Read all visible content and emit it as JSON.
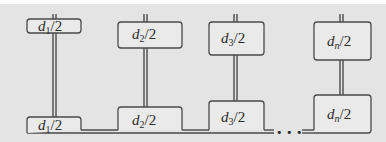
{
  "diagram": {
    "type": "tapered-stack-pairs",
    "colors": {
      "background": "#e4e4e4",
      "box_fill": "#e9e9e9",
      "stroke": "#4a4a4a",
      "top_strip": "#ffffff"
    },
    "top_boxes": [
      {
        "var": "d",
        "sub": "1",
        "rest": "/2"
      },
      {
        "var": "d",
        "sub": "2",
        "rest": "/2"
      },
      {
        "var": "d",
        "sub": "3",
        "rest": "/2"
      },
      {
        "var": "d",
        "sub": "n",
        "rest": "/2"
      }
    ],
    "bottom_boxes": [
      {
        "var": "d",
        "sub": "1",
        "rest": "/2"
      },
      {
        "var": "d",
        "sub": "2",
        "rest": "/2"
      },
      {
        "var": "d",
        "sub": "3",
        "rest": "/2"
      },
      {
        "var": "d",
        "sub": "n",
        "rest": "/2"
      }
    ],
    "ellipsis": "• • •"
  }
}
